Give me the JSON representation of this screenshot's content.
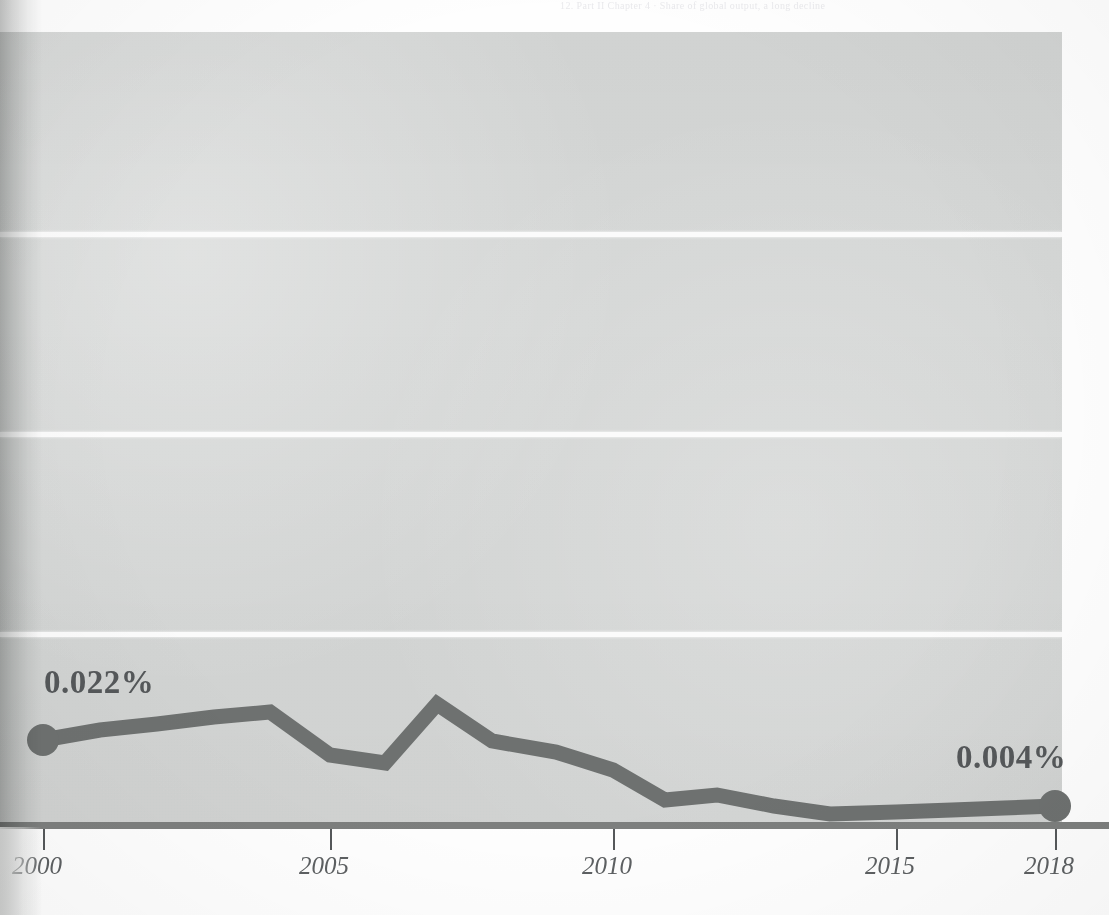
{
  "page": {
    "running_head": "12. Part II     Chapter 4  ·  Share of global output, a long decline",
    "background_color": "#fefefe",
    "panel_color": "#d4d6d5"
  },
  "colors": {
    "series_line": "#6e7170",
    "marker": "#6e7170",
    "axis": "#7d7f7e",
    "tick": "#55585a",
    "gridline": "#fbfbfb",
    "label_text": "#55585a",
    "tick_label_text": "#5d6062"
  },
  "annotations": {
    "start_value_label": "0.022%",
    "end_value_label": "0.004%"
  },
  "axis": {
    "x_tick_labels": [
      "2000",
      "2005",
      "2010",
      "2015",
      "2018"
    ],
    "x_tick_years": [
      2000,
      2005,
      2010,
      2015,
      2018
    ]
  },
  "chart_data": {
    "type": "line",
    "title": "",
    "subtitle": "",
    "xlabel": "",
    "ylabel": "",
    "grid": true,
    "legend": false,
    "xlim": [
      2000,
      2018
    ],
    "ylim": [
      0,
      0.2
    ],
    "y_gridline_values": [
      0.049,
      0.1,
      0.151
    ],
    "x_tick_labels": [
      "2000",
      "2005",
      "2010",
      "2015",
      "2018"
    ],
    "point_labels": {
      "2000": "0.022%",
      "2018": "0.004%"
    },
    "markers": [
      {
        "x": 2000,
        "y": 0.022,
        "label": "0.022%"
      },
      {
        "x": 2018,
        "y": 0.004,
        "label": "0.004%"
      }
    ],
    "x": [
      2000,
      2001,
      2002,
      2003,
      2004,
      2005,
      2006,
      2007,
      2008,
      2009,
      2010,
      2011,
      2012,
      2013,
      2014,
      2015,
      2016,
      2017,
      2018
    ],
    "series": [
      {
        "name": "share",
        "unit": "%",
        "values": [
          0.022,
          0.024,
          0.026,
          0.028,
          0.029,
          0.018,
          0.016,
          0.031,
          0.022,
          0.019,
          0.014,
          0.007,
          0.008,
          0.006,
          0.004,
          0.004,
          0.004,
          0.004,
          0.004
        ]
      }
    ]
  },
  "geometry": {
    "panel": {
      "x": 0,
      "y": 32,
      "w": 1062,
      "h": 795
    },
    "axis_y": 827,
    "gridlines_y": [
      232,
      432,
      632
    ],
    "ticks_x": [
      43,
      330,
      613,
      896,
      1055
    ],
    "line_points": "43,740 100,730 157,724 214,717 270,712 330,755 385,763 437,704 492,741 556,752 613,770 665,800 717,795 774,806 830,814 896,812 952,810 1004,808 1055,806"
  }
}
